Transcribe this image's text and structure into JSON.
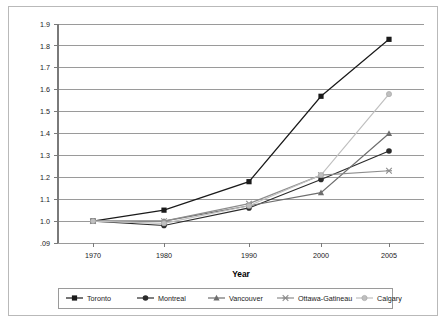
{
  "figure": {
    "frame_color": "#b9b9b9",
    "background": "#ffffff"
  },
  "chart_data": {
    "type": "line",
    "title": "",
    "subtitle": "",
    "xlabel": "Year",
    "ylabel": "",
    "categories": [
      "1970",
      "1980",
      "1990",
      "2000",
      "2005"
    ],
    "x_tick_labels": [
      "1970",
      "1980",
      "1990",
      "2000",
      "2005"
    ],
    "y_tick_labels": [
      "1.9",
      "1.8",
      "1.7",
      "1.6",
      "1.5",
      "1.4",
      "1.3",
      "1.2",
      "1.1",
      "1.0",
      ".09"
    ],
    "y_tick_values": [
      1.9,
      1.8,
      1.7,
      1.6,
      1.5,
      1.4,
      1.3,
      1.2,
      1.1,
      1.0,
      0.9
    ],
    "ylim": [
      0.9,
      1.9
    ],
    "grid": "horizontal",
    "legend_position": "bottom",
    "series": [
      {
        "name": "Toronto",
        "values": [
          1.0,
          1.05,
          1.18,
          1.57,
          1.83
        ],
        "color": "#1a1a1a",
        "marker": "square"
      },
      {
        "name": "Montreal",
        "values": [
          1.0,
          0.98,
          1.06,
          1.19,
          1.32
        ],
        "color": "#2b2b2b",
        "marker": "circle"
      },
      {
        "name": "Vancouver",
        "values": [
          1.0,
          1.0,
          1.07,
          1.13,
          1.4
        ],
        "color": "#6e6e6e",
        "marker": "triangle"
      },
      {
        "name": "Ottawa-Gatineau",
        "values": [
          1.0,
          1.0,
          1.08,
          1.21,
          1.23
        ],
        "color": "#8d8d8d",
        "marker": "cross"
      },
      {
        "name": "Calgary",
        "values": [
          1.0,
          0.99,
          1.07,
          1.21,
          1.58
        ],
        "color": "#bfbfbf",
        "marker": "circle-light"
      }
    ]
  },
  "legend": {
    "entries": [
      {
        "label": "Toronto"
      },
      {
        "label": "Montreal"
      },
      {
        "label": "Vancouver"
      },
      {
        "label": "Ottawa-Gatineau"
      },
      {
        "label": "Calgary"
      }
    ]
  },
  "axes": {
    "x_axis_title": "Year",
    "axis_line_color": "#7a7a7a",
    "gridline_color": "#9a9a9a"
  }
}
